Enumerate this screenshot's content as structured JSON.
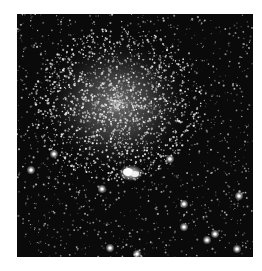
{
  "image": {
    "subject": "globular star cluster",
    "alt": "Grayscale astronomical image of a dense star cluster with a bright diffuse core in the upper-left-center and a bright compact object below it, surrounded by a dense field of stars",
    "background_color": "#0a0a0a",
    "core_center": [
      100,
      90
    ],
    "core_radius": 70,
    "bright_object_center": [
      114,
      159
    ],
    "bright_stars": [
      [
        14,
        156
      ],
      [
        222,
        182
      ],
      [
        190,
        226
      ],
      [
        220,
        235
      ],
      [
        167,
        213
      ],
      [
        153,
        145
      ],
      [
        93,
        234
      ],
      [
        37,
        140
      ],
      [
        167,
        190
      ],
      [
        120,
        240
      ],
      [
        198,
        220
      ],
      [
        85,
        175
      ]
    ]
  }
}
